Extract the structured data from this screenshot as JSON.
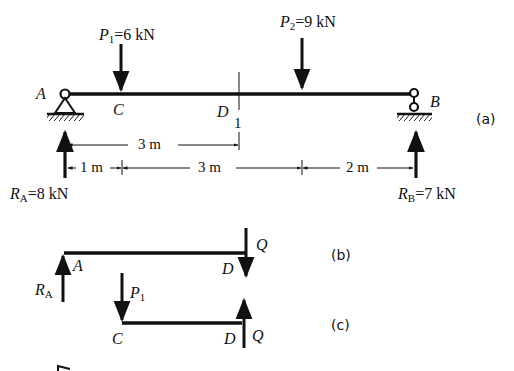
{
  "figure": {
    "panels": [
      {
        "id": "a",
        "tag": "(a)"
      },
      {
        "id": "b",
        "tag": "(b)"
      },
      {
        "id": "c",
        "tag": "(c)"
      }
    ]
  },
  "panel_a": {
    "points": {
      "A": "A",
      "B": "B",
      "C": "C",
      "D": "D"
    },
    "section_mark": "1",
    "loads": {
      "P1": {
        "symbol": "P",
        "sub": "1",
        "value": "=6 kN"
      },
      "P2": {
        "symbol": "P",
        "sub": "2",
        "value": "=9 kN"
      }
    },
    "reactions": {
      "RA": {
        "symbol": "R",
        "sub": "A",
        "value": "=8 kN"
      },
      "RB": {
        "symbol": "R",
        "sub": "B",
        "value": "=7 kN"
      }
    },
    "dimensions": {
      "A_to_D": "3 m",
      "A_to_C": "1 m",
      "C_to_P2": "3 m",
      "P2_to_B": "2 m"
    }
  },
  "panel_b": {
    "points": {
      "A": "A",
      "D": "D"
    },
    "reaction": {
      "symbol": "R",
      "sub": "A"
    },
    "shear": "Q"
  },
  "panel_c": {
    "points": {
      "C": "C",
      "D": "D"
    },
    "load": {
      "symbol": "P",
      "sub": "1"
    },
    "shear": "Q"
  },
  "colors": {
    "ink": "#111111",
    "background": "#ffffff"
  }
}
